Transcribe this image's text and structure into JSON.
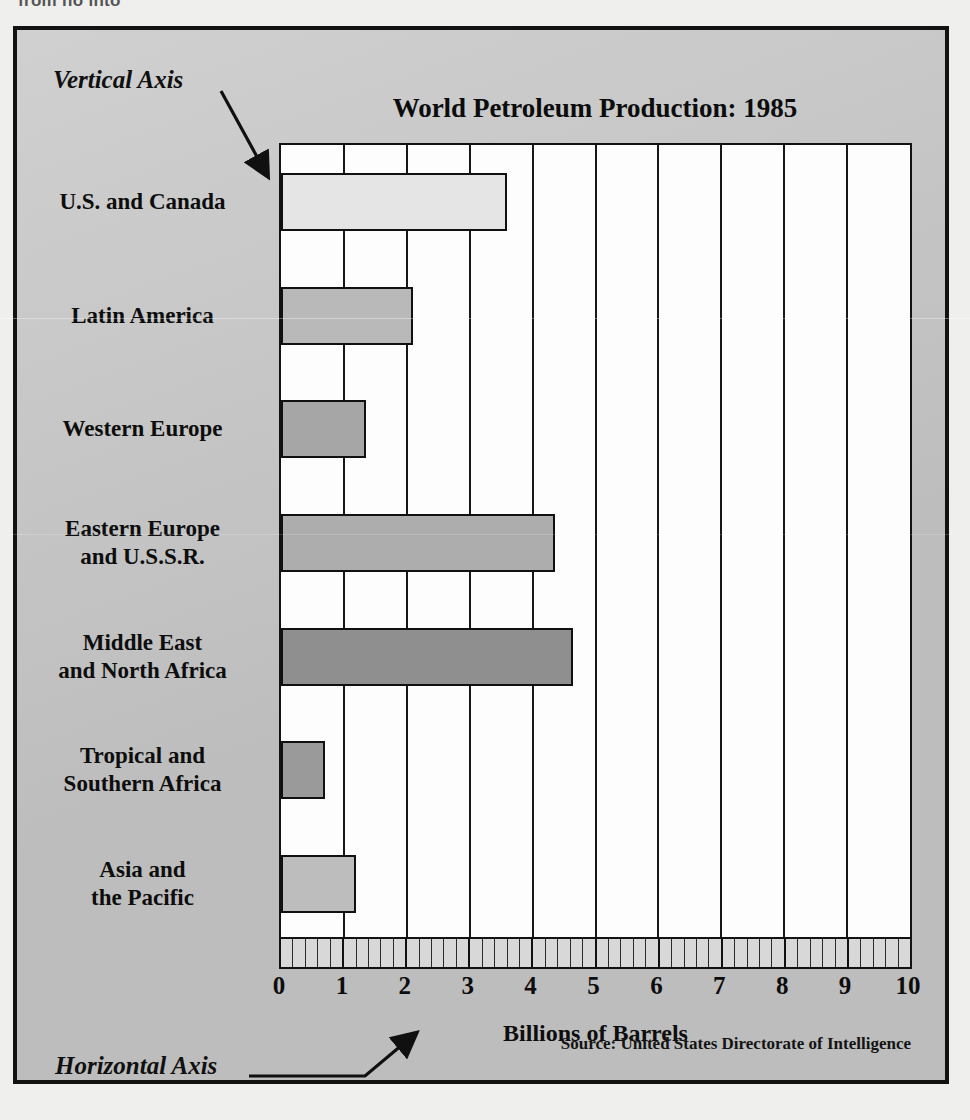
{
  "page": {
    "clipped_header_text": "from no into"
  },
  "annotations": {
    "vertical_axis_label": "Vertical Axis",
    "horizontal_axis_label": "Horizontal Axis"
  },
  "source_note": "Source: United States Directorate of Intelligence",
  "chart_data": {
    "type": "bar",
    "orientation": "horizontal",
    "title": "World Petroleum Production: 1985",
    "xlabel": "Billions of Barrels",
    "ylabel": "",
    "xlim": [
      0,
      10
    ],
    "xticks": [
      0,
      1,
      2,
      3,
      4,
      5,
      6,
      7,
      8,
      9,
      10
    ],
    "xtick_labels": [
      "0",
      "1",
      "2",
      "3",
      "4",
      "5",
      "6",
      "7",
      "8",
      "9",
      "10"
    ],
    "minor_ticks_per_unit": 5,
    "grid": true,
    "legend": "none",
    "categories": [
      "U.S. and Canada",
      "Latin America",
      "Western Europe",
      "Eastern Europe and U.S.S.R.",
      "Middle East and North Africa",
      "Tropical and Southern Africa",
      "Asia and the Pacific"
    ],
    "category_lines": [
      [
        "U.S. and Canada"
      ],
      [
        "Latin America"
      ],
      [
        "Western Europe"
      ],
      [
        "Eastern Europe",
        "and U.S.S.R."
      ],
      [
        "Middle East",
        "and North Africa"
      ],
      [
        "Tropical and",
        "Southern Africa"
      ],
      [
        "Asia and",
        "the Pacific"
      ]
    ],
    "values": [
      3.6,
      2.1,
      1.35,
      4.35,
      4.65,
      0.7,
      1.2
    ],
    "bar_colors": [
      "#e5e5e5",
      "#b9b9b9",
      "#a6a6a6",
      "#adadad",
      "#8f8f8f",
      "#9a9a9a",
      "#bdbdbd"
    ]
  },
  "colors": {
    "frame_background": "#c7c7c7",
    "plot_background": "#fdfdfd",
    "ink": "#121212",
    "page_background": "#efefed"
  }
}
